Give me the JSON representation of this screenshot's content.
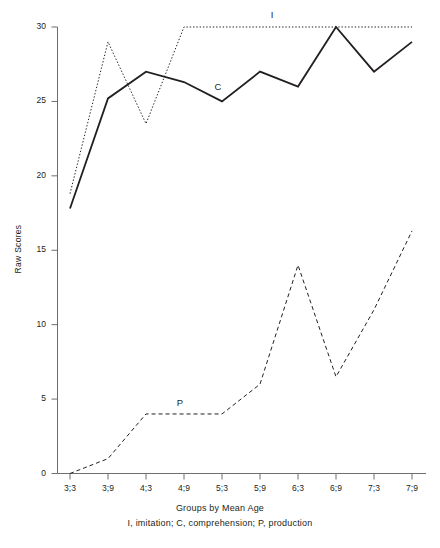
{
  "chart_data": {
    "type": "line",
    "title": "",
    "xlabel": "Groups by Mean Age",
    "ylabel": "Raw Scores",
    "categories": [
      "3;3",
      "3;9",
      "4;3",
      "4;9",
      "5;3",
      "5;9",
      "6;3",
      "6;9",
      "7;3",
      "7;9"
    ],
    "ylim": [
      0,
      30
    ],
    "yticks": [
      0,
      5,
      10,
      15,
      20,
      25,
      30
    ],
    "ytick_labels": [
      "0",
      "5",
      "10",
      "15",
      "20",
      "25",
      "30"
    ],
    "grid": false,
    "legend_position": "inline-annotations",
    "series": [
      {
        "name": "I",
        "label": "I",
        "description": "imitation",
        "style": "dotted",
        "color": "#231f20",
        "values": [
          18.8,
          29.0,
          23.5,
          30.0,
          30.0,
          30.0,
          30.0,
          30.0,
          30.0,
          30.0
        ]
      },
      {
        "name": "C",
        "label": "C",
        "description": "comprehension",
        "style": "solid",
        "color": "#231f20",
        "values": [
          17.8,
          25.2,
          27.0,
          26.3,
          25.0,
          27.0,
          26.0,
          30.0,
          27.0,
          29.0
        ]
      },
      {
        "name": "P",
        "label": "P",
        "description": "production",
        "style": "dashed",
        "color": "#231f20",
        "values": [
          0.0,
          1.0,
          4.0,
          4.0,
          4.0,
          6.0,
          14.0,
          6.5,
          11.0,
          16.3
        ]
      }
    ],
    "annotations": [
      {
        "text": "I",
        "series": "I",
        "x_px": 272,
        "y_px": 15
      },
      {
        "text": "C",
        "series": "C",
        "x_px": 218,
        "y_px": 87
      },
      {
        "text": "P",
        "series": "P",
        "x_px": 180,
        "y_px": 403
      }
    ],
    "footnote": "I, imitation; C, comprehension; P, production"
  },
  "axes": {
    "y_title": "Raw Scores",
    "x_title": "Groups by Mean Age"
  }
}
